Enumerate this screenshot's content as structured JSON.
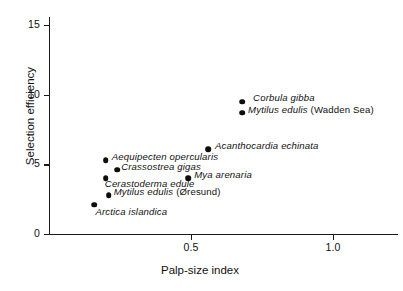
{
  "chart_data": {
    "type": "scatter",
    "title": "",
    "xlabel": "Palp-size index",
    "ylabel": "Selection efficiency",
    "xlim": [
      0,
      2.46
    ],
    "ylim": [
      0,
      15.6
    ],
    "xticks": [
      "0.5",
      "1.0",
      "1.5",
      "2.0"
    ],
    "xtick_values": [
      0.5,
      1.0,
      1.5,
      2.0
    ],
    "yticks": [
      "0",
      "5",
      "10",
      "15"
    ],
    "ytick_values": [
      0,
      5,
      10,
      15
    ],
    "grid": false,
    "legend": "none",
    "points": [
      {
        "label": "Spisula subtruncata",
        "label_plain": "",
        "x": 1.65,
        "y": 15.5,
        "label_side": "right"
      },
      {
        "label": "Corbula gibba",
        "label_plain": "",
        "x": 0.68,
        "y": 9.5,
        "label_side": "right"
      },
      {
        "label": "Mytilus edulis",
        "label_plain": "(Wadden Sea)",
        "x": 0.68,
        "y": 8.7,
        "label_side": "right"
      },
      {
        "label": "Acanthocardia  echinata",
        "label_plain": "",
        "x": 0.56,
        "y": 6.1,
        "label_side": "right"
      },
      {
        "label": "Musculus niger",
        "label_plain": "",
        "x": 1.8,
        "y": 6.1,
        "label_side": "right"
      },
      {
        "label": "Aequipecten  opercularis",
        "label_plain": "",
        "x": 0.2,
        "y": 5.3,
        "label_side": "right"
      },
      {
        "label": "Crassostrea gigas",
        "label_plain": "",
        "x": 0.24,
        "y": 4.6,
        "label_side": "right"
      },
      {
        "label": "Mya arenaria",
        "label_plain": "",
        "x": 0.49,
        "y": 4.0,
        "label_side": "right"
      },
      {
        "label": "Cerastoderma edule",
        "label_plain": "",
        "x": 0.2,
        "y": 4.0,
        "label_side": "below"
      },
      {
        "label": "Mytilus edulis",
        "label_plain": "(Øresund)",
        "x": 0.21,
        "y": 2.8,
        "label_side": "right"
      },
      {
        "label": "Arctica  islandica",
        "label_plain": "",
        "x": 0.16,
        "y": 2.1,
        "label_side": "below-right"
      }
    ]
  },
  "colors": {
    "marker": "#0d0d0d",
    "axis": "#1a1a1a",
    "text": "#111111",
    "background": "#ffffff"
  }
}
